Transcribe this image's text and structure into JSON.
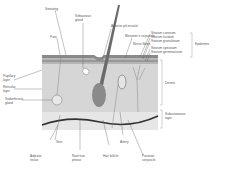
{
  "diagram": {
    "colors": {
      "epidermis": "#8a8a8a",
      "epidermis_light": "#b5b5b5",
      "dermis": "#d6d6d6",
      "subcutaneous": "#e6e6e6",
      "hair": "#6a6a6a",
      "artery": "#333333",
      "leader_line": "#666666",
      "label_text": "#555555"
    },
    "labels": {
      "sweating": "Sweating",
      "sebaceous_gland": "Sebaceous\ngland",
      "arrector_pili": "Arrector pili muscle",
      "pore": "Pore",
      "meissners": "Meissner's corpuscle",
      "nerve_fibres": "Nerve fibres",
      "stratum_corneum": "Stratum corneum",
      "stratum_lucidum": "Stratum lucidum",
      "stratum_granulosum": "Stratum granulosum",
      "stratum_spinosum": "Stratum spinosum",
      "stratum_germinativum": "Stratum germinativum",
      "epidermis": "Epidermis",
      "papillary_layer": "Papillary\nlayer",
      "reticular_layer": "Reticular\nlayer",
      "sudoriferous_gland": "Sudoriferous\ngland",
      "dermis": "Dermis",
      "subcutaneous_layer": "Subcutaneous\nlayer",
      "adipose_tissue": "Adipose\ntissue",
      "vein": "Vein",
      "root_hair_plexus": "Root hair\nplexus",
      "hair_follicle": "Hair follicle",
      "artery": "Artery",
      "pacinian_corpuscle": "Pacinian\ncorpuscle"
    }
  }
}
